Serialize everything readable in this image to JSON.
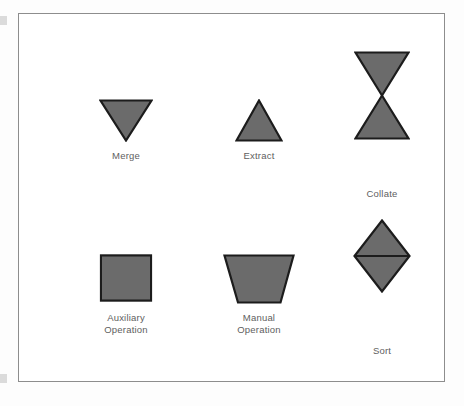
{
  "figure": {
    "background_color": "#ffffff",
    "frame_border_color": "#8d8d8d",
    "shape_fill_color": "#6b6b6b",
    "shape_stroke_color": "#1c1c1c",
    "label_color": "#5e5e5e"
  },
  "symbols": [
    {
      "key": "merge",
      "label": "Merge",
      "icon": "inverted-triangle-shape",
      "row": 1,
      "column": 1
    },
    {
      "key": "extract",
      "label": "Extract",
      "icon": "triangle-shape",
      "row": 1,
      "column": 2
    },
    {
      "key": "collate",
      "label": "Collate",
      "icon": "hourglass-bowtie-shape",
      "row": 1,
      "column": 3
    },
    {
      "key": "auxiliary_operation",
      "label": "Auxiliary\nOperation",
      "icon": "square-shape",
      "row": 2,
      "column": 1
    },
    {
      "key": "manual_operation",
      "label": "Manual\nOperation",
      "icon": "inverted-trapezoid-shape",
      "row": 2,
      "column": 2
    },
    {
      "key": "sort",
      "label": "Sort",
      "icon": "diamond-with-horizontal-bar-shape",
      "row": 2,
      "column": 3
    }
  ]
}
